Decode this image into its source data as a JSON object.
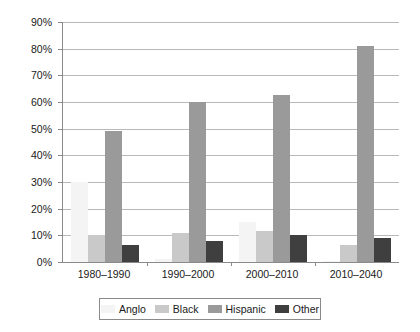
{
  "chart_data": {
    "type": "bar",
    "title": "",
    "subtitle": "",
    "xlabel": "",
    "ylabel": "",
    "categories": [
      "1980–1990",
      "1990–2000",
      "2000–2010",
      "2010–2040"
    ],
    "series": [
      {
        "name": "Anglo",
        "color": "#f4f4f4",
        "values": [
          30.0,
          1.0,
          15.0,
          0.5
        ]
      },
      {
        "name": "Black",
        "color": "#c9c9c9",
        "values": [
          10.0,
          11.0,
          11.5,
          6.5
        ]
      },
      {
        "name": "Hispanic",
        "color": "#9a9a9a",
        "values": [
          49.0,
          60.0,
          62.5,
          81.0
        ]
      },
      {
        "name": "Other",
        "color": "#3f3f3f",
        "values": [
          6.5,
          8.0,
          10.0,
          9.0
        ]
      }
    ],
    "ylim": [
      0,
      90
    ],
    "ytick_values": [
      0,
      10,
      20,
      30,
      40,
      50,
      60,
      70,
      80,
      90
    ],
    "ytick_labels": [
      "0%",
      "10%",
      "20%",
      "30%",
      "40%",
      "50%",
      "60%",
      "70%",
      "80%",
      "90%"
    ],
    "grid": true,
    "grid_axis": "y",
    "legend_position": "bottom",
    "legend_entries": [
      "Anglo",
      "Black",
      "Hispanic",
      "Other"
    ],
    "annotations": []
  },
  "colors": {
    "axis": "#8a8a8a",
    "gridline": "#b9b9b9",
    "background": "#ffffff",
    "text": "#1a1a1a"
  }
}
